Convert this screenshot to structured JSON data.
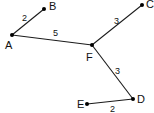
{
  "graph": {
    "nodes": [
      {
        "id": "A",
        "label": "A",
        "x": 12,
        "y": 35,
        "lx": 5,
        "ly": 49
      },
      {
        "id": "B",
        "label": "B",
        "x": 44,
        "y": 9,
        "lx": 49,
        "ly": 10
      },
      {
        "id": "C",
        "label": "C",
        "x": 142,
        "y": 5,
        "lx": 146,
        "ly": 8
      },
      {
        "id": "F",
        "label": "F",
        "x": 92,
        "y": 45,
        "lx": 86,
        "ly": 61
      },
      {
        "id": "D",
        "label": "D",
        "x": 133,
        "y": 99,
        "lx": 137,
        "ly": 103
      },
      {
        "id": "E",
        "label": "E",
        "x": 87,
        "y": 104,
        "lx": 77,
        "ly": 108
      }
    ],
    "edges": [
      {
        "from": "A",
        "to": "B",
        "weight": "2",
        "wx": 22,
        "wy": 21
      },
      {
        "from": "A",
        "to": "F",
        "weight": "5",
        "wx": 53,
        "wy": 36
      },
      {
        "from": "F",
        "to": "C",
        "weight": "3",
        "wx": 114,
        "wy": 24
      },
      {
        "from": "F",
        "to": "D",
        "weight": "3",
        "wx": 115,
        "wy": 74
      },
      {
        "from": "E",
        "to": "D",
        "weight": "2",
        "wx": 110,
        "wy": 112
      }
    ]
  }
}
